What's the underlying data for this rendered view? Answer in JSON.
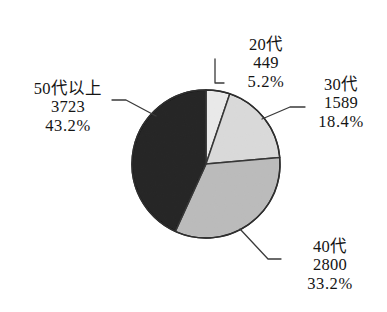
{
  "chart_data": {
    "type": "pie",
    "title": "",
    "legend_position": "none",
    "labels_inline": true,
    "start_angle_deg": 0,
    "direction": "clockwise",
    "categories": [
      "20代",
      "30代",
      "40代",
      "50代以上"
    ],
    "values": [
      449,
      1589,
      2800,
      3723
    ],
    "percents": [
      5.2,
      18.4,
      33.2,
      43.2
    ],
    "colors": [
      "#ffffff",
      "#ececec",
      "#c8c8c8",
      "#121212"
    ],
    "slices": [
      {
        "category": "20代",
        "value": "449",
        "percent": "5.2%",
        "color": "#ffffff",
        "start_deg": 0,
        "end_deg": 18.7
      },
      {
        "category": "30代",
        "value": "1589",
        "percent": "18.4%",
        "color": "#ececec",
        "start_deg": 18.7,
        "end_deg": 85.0
      },
      {
        "category": "40代",
        "value": "2800",
        "percent": "33.2%",
        "color": "#c8c8c8",
        "start_deg": 85.0,
        "end_deg": 204.5
      },
      {
        "category": "50代以上",
        "value": "3723",
        "percent": "43.2%",
        "color": "#121212",
        "start_deg": 204.5,
        "end_deg": 360
      }
    ]
  },
  "labels": {
    "twenties": {
      "category": "20代",
      "value": "449",
      "percent": "5.2%"
    },
    "thirties": {
      "category": "30代",
      "value": "1589",
      "percent": "18.4%"
    },
    "forties": {
      "category": "40代",
      "value": "2800",
      "percent": "33.2%"
    },
    "fifties_plus": {
      "category": "50代以上",
      "value": "3723",
      "percent": "43.2%"
    }
  },
  "style": {
    "outline_color": "#2a2a2a",
    "leader_color": "#3a3a3a",
    "background": "#ffffff"
  }
}
